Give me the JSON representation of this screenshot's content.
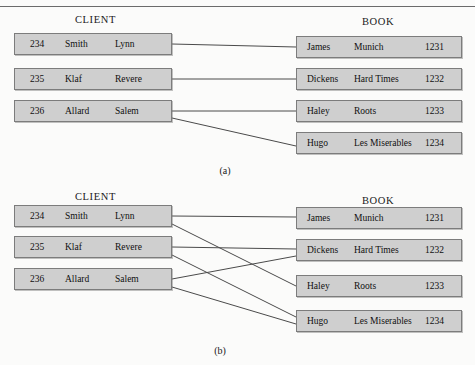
{
  "figure": {
    "width": 475,
    "height": 365,
    "background": "#fbfbfa",
    "box_fill": "#cfcfcf",
    "box_border": "#7c7c7c",
    "line_color": "#4a4a4a"
  },
  "panels": [
    {
      "id": "a",
      "caption": "(a)",
      "client": {
        "title": "CLIENT",
        "rows": [
          {
            "id": "234",
            "last": "Smith",
            "first": "Lynn"
          },
          {
            "id": "235",
            "last": "Klaf",
            "first": "Revere"
          },
          {
            "id": "236",
            "last": "Allard",
            "first": "Salem"
          }
        ]
      },
      "book": {
        "title": "BOOK",
        "rows": [
          {
            "author": "James",
            "title": "Munich",
            "id": "1231"
          },
          {
            "author": "Dickens",
            "title": "Hard Times",
            "id": "1232"
          },
          {
            "author": "Haley",
            "title": "Roots",
            "id": "1233"
          },
          {
            "author": "Hugo",
            "title": "Les Miserables",
            "id": "1234"
          }
        ]
      },
      "links": [
        {
          "from": 0,
          "to": 0
        },
        {
          "from": 1,
          "to": 1
        },
        {
          "from": 2,
          "to": 2
        },
        {
          "from": 2,
          "to": 3
        }
      ]
    },
    {
      "id": "b",
      "caption": "(b)",
      "client": {
        "title": "CLIENT",
        "rows": [
          {
            "id": "234",
            "last": "Smith",
            "first": "Lynn"
          },
          {
            "id": "235",
            "last": "Klaf",
            "first": "Revere"
          },
          {
            "id": "236",
            "last": "Allard",
            "first": "Salem"
          }
        ]
      },
      "book": {
        "title": "BOOK",
        "rows": [
          {
            "author": "James",
            "title": "Munich",
            "id": "1231"
          },
          {
            "author": "Dickens",
            "title": "Hard Times",
            "id": "1232"
          },
          {
            "author": "Haley",
            "title": "Roots",
            "id": "1233"
          },
          {
            "author": "Hugo",
            "title": "Les Miserables",
            "id": "1234"
          }
        ]
      },
      "links": [
        {
          "from": 0,
          "to": 0
        },
        {
          "from": 0,
          "to": 2
        },
        {
          "from": 1,
          "to": 1
        },
        {
          "from": 1,
          "to": 3
        },
        {
          "from": 2,
          "to": 1
        },
        {
          "from": 2,
          "to": 3
        }
      ]
    }
  ]
}
